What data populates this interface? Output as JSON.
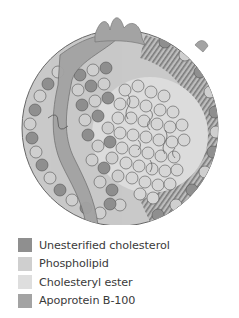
{
  "figure": {
    "colors": {
      "unesterified_cholesterol": "#8f8f8f",
      "phospholipid": "#cfcfcf",
      "cholesteryl_ester": "#dedede",
      "apoprotein": "#a3a3a3",
      "outline": "#555555",
      "background": "#ffffff"
    }
  },
  "legend": {
    "items": [
      {
        "label": "Unesterified cholesterol",
        "color": "#8f8f8f"
      },
      {
        "label": "Phospholipid",
        "color": "#cfcfcf"
      },
      {
        "label": "Cholesteryl ester",
        "color": "#dedede"
      },
      {
        "label": "Apoprotein B-100",
        "color": "#a3a3a3"
      }
    ]
  }
}
